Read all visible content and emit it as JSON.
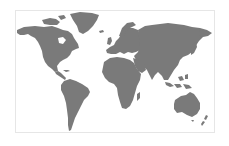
{
  "map": {
    "type": "world-map",
    "projection": "equirectangular",
    "colors": {
      "land": "#7a7a7a",
      "ocean": "#ffffff",
      "frame": "#e6e6e6"
    },
    "regions": [
      "north-america",
      "greenland",
      "south-america",
      "europe",
      "africa",
      "asia",
      "australia",
      "indonesia",
      "japan",
      "new-zealand",
      "madagascar",
      "uk",
      "arctic-islands"
    ]
  }
}
